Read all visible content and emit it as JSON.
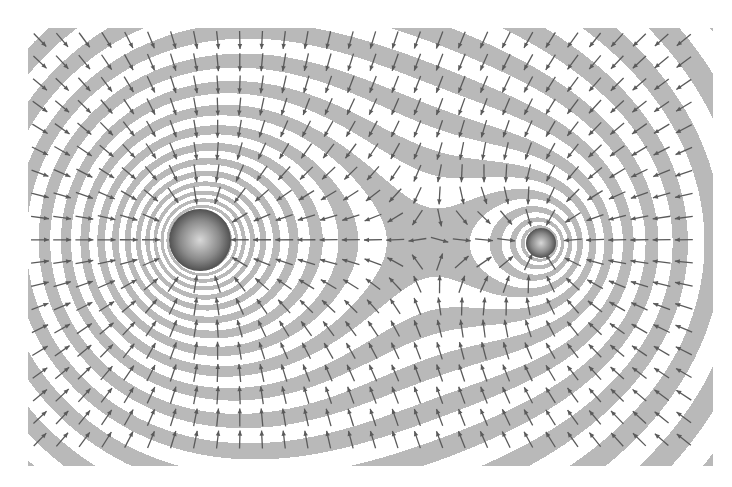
{
  "figure": {
    "title": "",
    "canvas": {
      "width": 732,
      "height": 487
    },
    "plot_region": {
      "x0": 28,
      "y0": 28,
      "x1": 712,
      "y1": 465
    },
    "clip_polygon": [
      [
        28,
        28
      ],
      [
        90,
        28
      ],
      [
        118,
        28
      ],
      [
        690,
        28
      ],
      [
        712,
        28
      ],
      [
        712,
        185
      ],
      [
        712,
        465
      ],
      [
        90,
        465
      ],
      [
        28,
        465
      ],
      [
        28,
        28
      ]
    ],
    "colors": {
      "background": "#ffffff",
      "band": "#b9b9b9",
      "arrow": "#5a5a5a",
      "mass_dark": "#2f2f2f"
    },
    "masses": [
      {
        "name": "large-mass",
        "x": 200,
        "y": 240,
        "radius": 31,
        "strength": 1.0
      },
      {
        "name": "small-mass",
        "x": 541,
        "y": 243,
        "radius": 15,
        "strength": 0.48
      }
    ],
    "bands": {
      "potential": "log",
      "step": 0.085,
      "offset": 0.03
    },
    "arrows": {
      "spacing": 22.2,
      "start_x": 40,
      "start_y": 40,
      "length": 18,
      "head": 5
    },
    "saddle_point": {
      "x": 430,
      "y": 243
    }
  }
}
